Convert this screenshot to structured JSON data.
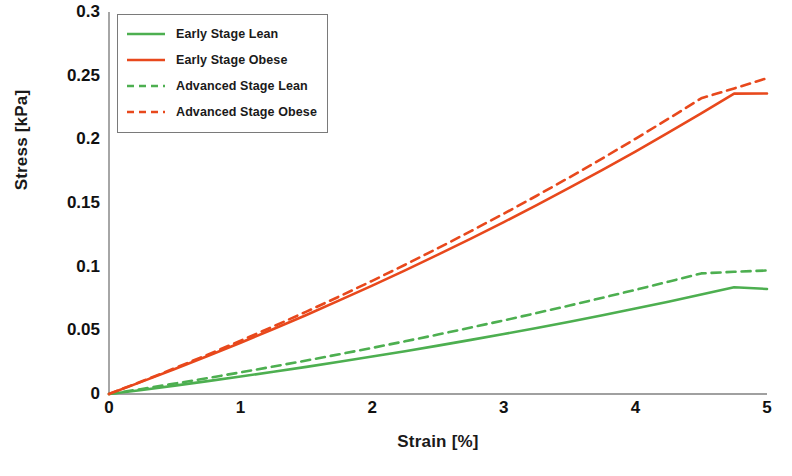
{
  "chart_data": {
    "type": "line",
    "title": "",
    "xlabel": "Strain [%]",
    "ylabel": "Stress [kPa]",
    "xlim": [
      0,
      5
    ],
    "ylim": [
      0,
      0.3
    ],
    "xticks": [
      "0",
      "1",
      "2",
      "3",
      "4",
      "5"
    ],
    "yticks": [
      "0",
      "0.05",
      "0.1",
      "0.15",
      "0.2",
      "0.25",
      "0.3"
    ],
    "grid": false,
    "legend_position": "top-left",
    "x": [
      0,
      0.25,
      0.5,
      0.75,
      1,
      1.25,
      1.5,
      1.75,
      2,
      2.25,
      2.5,
      2.75,
      3,
      3.25,
      3.5,
      3.75,
      4,
      4.25,
      4.5,
      4.75,
      5
    ],
    "series": [
      {
        "name": "Early Stage Lean",
        "color": "#4DAF50",
        "style": "solid",
        "values": [
          0,
          0.0032,
          0.0066,
          0.0101,
          0.0137,
          0.0175,
          0.0213,
          0.0253,
          0.0294,
          0.0336,
          0.038,
          0.0425,
          0.0471,
          0.0519,
          0.0568,
          0.0619,
          0.0671,
          0.0725,
          0.0781,
          0.0838,
          0.0825
        ]
      },
      {
        "name": "Early Stage Obese",
        "color": "#E8481C",
        "style": "solid",
        "values": [
          0,
          0.0097,
          0.0196,
          0.0298,
          0.0403,
          0.0511,
          0.0621,
          0.0735,
          0.0851,
          0.0971,
          0.1094,
          0.122,
          0.135,
          0.1483,
          0.162,
          0.176,
          0.1904,
          0.2052,
          0.2203,
          0.2359,
          0.236
        ]
      },
      {
        "name": "Advanced Stage Lean",
        "color": "#4DAF50",
        "style": "dashed",
        "values": [
          0,
          0.004,
          0.0082,
          0.0125,
          0.017,
          0.0216,
          0.0263,
          0.0312,
          0.0362,
          0.0414,
          0.0467,
          0.0522,
          0.0578,
          0.0636,
          0.0695,
          0.0756,
          0.0818,
          0.0882,
          0.0947,
          0.096,
          0.097
        ]
      },
      {
        "name": "Advanced Stage Obese",
        "color": "#E8481C",
        "style": "dashed",
        "values": [
          0,
          0.01,
          0.0203,
          0.0309,
          0.0418,
          0.0531,
          0.0647,
          0.0766,
          0.0889,
          0.1015,
          0.1145,
          0.1279,
          0.1416,
          0.1557,
          0.1702,
          0.1851,
          0.2004,
          0.2161,
          0.2322,
          0.24,
          0.248
        ]
      }
    ]
  },
  "axes": {
    "ylabel": "Stress [kPa]",
    "xlabel": "Strain [%]",
    "yticks": [
      "0.3",
      "0.25",
      "0.2",
      "0.15",
      "0.1",
      "0.05",
      "0"
    ],
    "xticks": [
      "0",
      "1",
      "2",
      "3",
      "4",
      "5"
    ]
  },
  "legend": {
    "items": [
      {
        "label": "Early Stage Lean",
        "color": "#4DAF50",
        "style": "solid"
      },
      {
        "label": "Early Stage Obese",
        "color": "#E8481C",
        "style": "solid"
      },
      {
        "label": "Advanced Stage Lean",
        "color": "#4DAF50",
        "style": "dashed"
      },
      {
        "label": "Advanced Stage Obese",
        "color": "#E8481C",
        "style": "dashed"
      }
    ]
  },
  "colors": {
    "lean": "#4DAF50",
    "obese": "#E8481C",
    "axis": "#808080",
    "text": "#111111"
  }
}
